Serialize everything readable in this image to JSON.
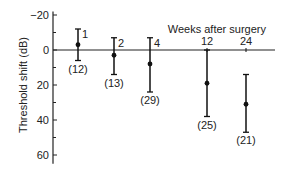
{
  "chart_data": {
    "type": "scatter",
    "title": "",
    "xlabel": "Weeks after surgery",
    "ylabel": "Threshold shift (dB)",
    "ylim": [
      -20,
      65
    ],
    "y_inverted": true,
    "yticks": [
      -20,
      0,
      20,
      40,
      60
    ],
    "ytick_labels": [
      "-20",
      "0",
      "20",
      "40",
      "60"
    ],
    "grid": false,
    "legend": null,
    "categories": [
      "1",
      "2",
      "4",
      "12",
      "24"
    ],
    "series": [
      {
        "name": "Mean threshold shift",
        "x": [
          1,
          2,
          4,
          12,
          24
        ],
        "values": [
          -3,
          3,
          8,
          19,
          31
        ],
        "error_low": [
          -12,
          -7,
          -7,
          0,
          14
        ],
        "error_high": [
          6,
          14,
          24,
          38,
          47
        ],
        "n_labels": [
          "(12)",
          "(13)",
          "(29)",
          "(25)",
          "(21)"
        ]
      }
    ]
  }
}
